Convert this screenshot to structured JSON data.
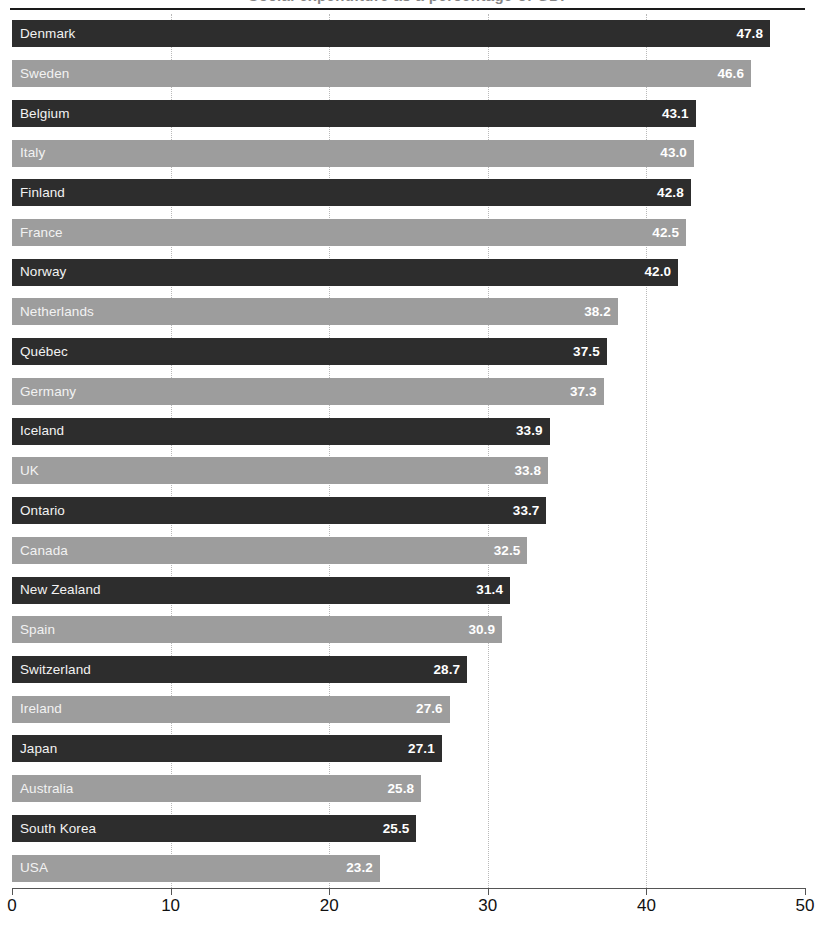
{
  "figure": {
    "title_cut_off": "Social expenditure as a percentage of GDP",
    "rule_visible": true
  },
  "chart_data": {
    "type": "bar",
    "orientation": "horizontal",
    "title": "",
    "xlabel": "",
    "ylabel": "",
    "xlim": [
      0,
      50
    ],
    "xticks": [
      0,
      10,
      20,
      30,
      40,
      50
    ],
    "xtick_labels": [
      "0",
      "10",
      "20",
      "30",
      "40",
      "50"
    ],
    "grid": true,
    "grid_axis": "x",
    "grid_style": "dotted",
    "legend": false,
    "bar_colors": {
      "dark": "#2d2d2d",
      "light": "#9d9d9d",
      "pattern": "alternating dark/light by row"
    },
    "value_label_position": "inside-right",
    "sorted": "descending",
    "categories": [
      "Denmark",
      "Sweden",
      "Belgium",
      "Italy",
      "Finland",
      "France",
      "Norway",
      "Netherlands",
      "Québec",
      "Germany",
      "Iceland",
      "UK",
      "Ontario",
      "Canada",
      "New Zealand",
      "Spain",
      "Switzerland",
      "Ireland",
      "Japan",
      "Australia",
      "South Korea",
      "USA"
    ],
    "values": [
      47.8,
      46.6,
      43.1,
      43.0,
      42.8,
      42.5,
      42.0,
      38.2,
      37.5,
      37.3,
      33.9,
      33.8,
      33.7,
      32.5,
      31.4,
      30.9,
      28.7,
      27.6,
      27.1,
      25.8,
      25.5,
      23.2
    ],
    "value_labels": [
      "47.8",
      "46.6",
      "43.1",
      "43.0",
      "42.8",
      "42.5",
      "42.0",
      "38.2",
      "37.5",
      "37.3",
      "33.9",
      "33.8",
      "33.7",
      "32.5",
      "31.4",
      "30.9",
      "28.7",
      "27.6",
      "27.1",
      "25.8",
      "25.5",
      "23.2"
    ],
    "shades": [
      "dark",
      "light",
      "dark",
      "light",
      "dark",
      "light",
      "dark",
      "light",
      "dark",
      "light",
      "dark",
      "light",
      "dark",
      "light",
      "dark",
      "light",
      "dark",
      "light",
      "dark",
      "light",
      "dark",
      "light"
    ]
  }
}
